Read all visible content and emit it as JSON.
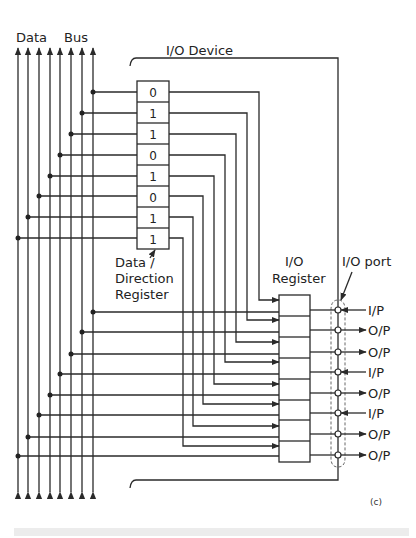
{
  "labels": {
    "data_bus": [
      "Data",
      "Bus"
    ],
    "io_device": "I/O Device",
    "ddr": [
      "Data /",
      "Direction",
      "Register"
    ],
    "io_register": [
      "I/O",
      "Register"
    ],
    "io_port": "I/O port",
    "figure_tag": "(c)"
  },
  "ddr_bits": [
    "0",
    "1",
    "1",
    "0",
    "1",
    "0",
    "1",
    "1"
  ],
  "port_directions": [
    "I/P",
    "O/P",
    "O/P",
    "I/P",
    "O/P",
    "I/P",
    "O/P",
    "O/P"
  ],
  "colors": {
    "line": "#2a2a2a",
    "background": "#ffffff"
  }
}
